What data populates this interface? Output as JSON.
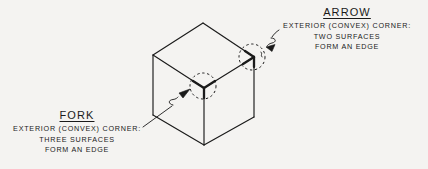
{
  "figure": {
    "background_color": "#f4f3f1",
    "ink_color": "#1a1a1a"
  },
  "annotations": [
    {
      "id": "arrow",
      "heading": "ARROW",
      "lines": [
        "EXTERIOR (CONVEX) CORNER:",
        "TWO SURFACES",
        "FORM AN EDGE"
      ]
    },
    {
      "id": "fork",
      "heading": "FORK",
      "lines": [
        "EXTERIOR (CONVEX) CORNER:",
        "THREE SURFACES",
        "FORM AN EDGE"
      ]
    }
  ],
  "cube": {
    "vertices": {
      "top_apex": [
        203,
        23
      ],
      "left_top": [
        153,
        55
      ],
      "right_top": [
        254,
        57
      ],
      "center_front_top": [
        204,
        88
      ],
      "left_bottom": [
        153,
        115
      ],
      "front_bottom": [
        204,
        145
      ],
      "right_bottom": [
        254,
        117
      ]
    }
  },
  "callouts": {
    "arrow_circle": {
      "cx": 252,
      "cy": 57,
      "r": 13
    },
    "fork_circle": {
      "cx": 203,
      "cy": 86,
      "r": 13
    }
  }
}
